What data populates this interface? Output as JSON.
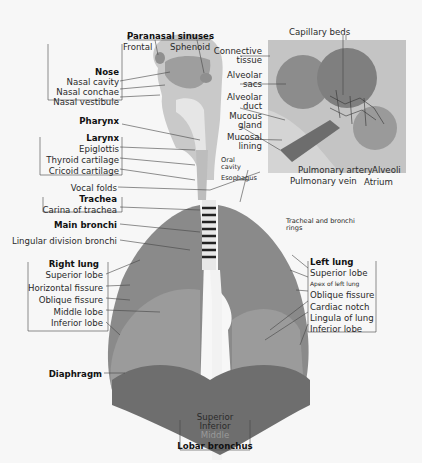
{
  "diagram": {
    "groups": {
      "paranasal_sinuses": {
        "title": "Paranasal sinuses",
        "items": [
          "Frontal",
          "Sphenoid"
        ]
      },
      "nose": {
        "title": "Nose",
        "items": [
          "Nasal cavity",
          "Nasal conchae",
          "Nasal vestibule"
        ]
      },
      "pharynx": {
        "title": "Pharynx"
      },
      "larynx": {
        "title": "Larynx",
        "items": [
          "Epiglottis",
          "Thyroid cartilage",
          "Cricoid cartilage"
        ]
      },
      "vocal_folds": "Vocal folds",
      "trachea": {
        "title": "Trachea",
        "items": [
          "Carina of trachea"
        ]
      },
      "main_bronchi": "Main bronchi",
      "lingular_division_bronchi": "Lingular division bronchi",
      "right_lung": {
        "title": "Right lung",
        "items": [
          "Superior lobe",
          "Horizontal fissure",
          "Oblique fissure",
          "Middle lobe",
          "Inferior lobe"
        ]
      },
      "diaphragm": "Diaphragm",
      "lobar_bronchus": {
        "title": "Lobar bronchus",
        "items": [
          "Superior",
          "Inferior",
          "Middle"
        ]
      },
      "left_lung": {
        "title": "Left lung",
        "items": [
          "Superior lobe",
          "Apex of left lung",
          "Oblique fissure",
          "Cardiac notch",
          "Lingula of lung",
          "Inferior lobe"
        ]
      },
      "alveolus_inset": {
        "capillary_beds": "Capillary beds",
        "connective_tissue": [
          "Connective",
          "tissue"
        ],
        "alveolar_sacs": [
          "Alveolar",
          "sacs"
        ],
        "alveolar_duct": [
          "Alveolar",
          "duct"
        ],
        "mucous_gland": [
          "Mucous",
          "gland"
        ],
        "mucosal_lining": [
          "Mucosal",
          "lining"
        ],
        "pulmonary_artery": "Pulmonary artery",
        "pulmonary_vein": "Pulmonary vein",
        "alveoli": "Alveoli",
        "atrium": "Atrium"
      },
      "oral_cavity": [
        "Oral",
        "cavity"
      ],
      "esophagus": "Esophagus",
      "tracheal_rings": [
        "Tracheal and bronchi",
        "rings"
      ]
    },
    "colors": {
      "background": "#f7f7f7",
      "lung": "#8a8a8a",
      "lung_light": "#b4b4b4",
      "diaphragm": "#6e6e6e",
      "airway": "#d9d9d9",
      "lines": "#444444"
    }
  }
}
